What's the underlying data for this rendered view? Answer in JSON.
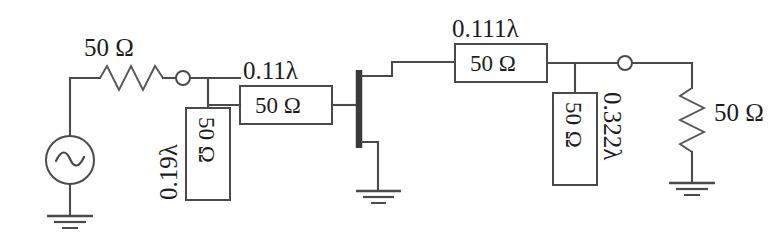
{
  "diagram": {
    "stroke_color": "#4a4a4a",
    "text_color": "#1c1c1c",
    "background": "#ffffff"
  },
  "labels": {
    "source_resistor": "50 Ω",
    "input_stub_length": "0.19λ",
    "input_stub_impedance": "50 Ω",
    "input_line_length": "0.11λ",
    "input_line_impedance": "50 Ω",
    "output_line_length": "0.111λ",
    "output_line_impedance": "50 Ω",
    "output_stub_impedance": "50 Ω",
    "output_stub_length": "0.322λ",
    "load_resistor": "50 Ω"
  },
  "components": {
    "ac_source": "ac-voltage-source",
    "transistor": "fet-transistor",
    "grounds": [
      "source-ground",
      "transistor-source-ground",
      "load-ground"
    ],
    "nodes": [
      "input-node",
      "output-node"
    ]
  }
}
